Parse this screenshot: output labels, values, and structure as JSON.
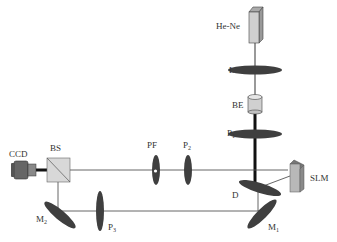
{
  "diagram": {
    "type": "optical-setup",
    "components": {
      "laser": {
        "label": "He-Ne"
      },
      "lens": {
        "label": "L"
      },
      "beam_expander": {
        "label": "BE"
      },
      "polarizer1": {
        "label": "P",
        "sub": "1"
      },
      "polarizer2": {
        "label": "P",
        "sub": "2"
      },
      "polarizer3": {
        "label": "P",
        "sub": "3"
      },
      "pinhole_filter": {
        "label": "PF"
      },
      "slm": {
        "label": "SLM"
      },
      "diffuser": {
        "label": "D"
      },
      "mirror1": {
        "label": "M",
        "sub": "1"
      },
      "mirror2": {
        "label": "M",
        "sub": "2"
      },
      "beam_splitter": {
        "label": "BS"
      },
      "camera": {
        "label": "CCD"
      }
    },
    "colors": {
      "element_fill": "#3f3f3f",
      "beam": "#555555",
      "box_fill": "#c8c8c8",
      "background": "#ffffff"
    }
  }
}
